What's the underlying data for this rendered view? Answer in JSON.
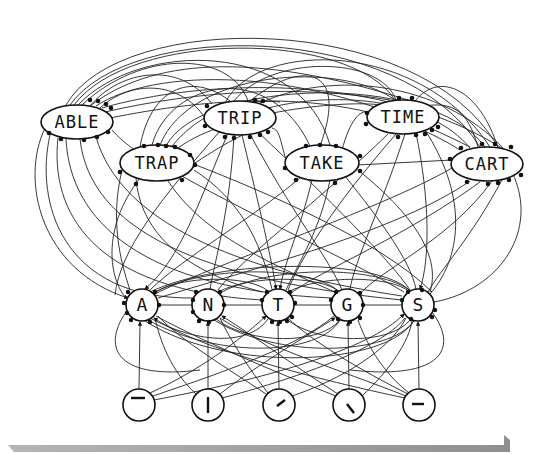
{
  "diagram": {
    "type": "interactive-activation network",
    "layers": {
      "word_level": {
        "nodes": [
          {
            "id": "ABLE",
            "label": "ABLE",
            "cx": 77,
            "cy": 122
          },
          {
            "id": "TRAP",
            "label": "TRAP",
            "cx": 157,
            "cy": 163
          },
          {
            "id": "TRIP",
            "label": "TRIP",
            "cx": 240,
            "cy": 118
          },
          {
            "id": "TAKE",
            "label": "TAKE",
            "cx": 322,
            "cy": 163
          },
          {
            "id": "TIME",
            "label": "TIME",
            "cx": 403,
            "cy": 117
          },
          {
            "id": "CART",
            "label": "CART",
            "cx": 487,
            "cy": 164
          }
        ]
      },
      "letter_level": {
        "nodes": [
          {
            "id": "A",
            "label": "A",
            "cx": 142,
            "cy": 305
          },
          {
            "id": "N",
            "label": "N",
            "cx": 208,
            "cy": 305
          },
          {
            "id": "T",
            "label": "T",
            "cx": 278,
            "cy": 305
          },
          {
            "id": "G",
            "label": "G",
            "cx": 347,
            "cy": 305
          },
          {
            "id": "S",
            "label": "S",
            "cx": 418,
            "cy": 305
          }
        ]
      },
      "feature_level": {
        "nodes": [
          {
            "id": "f1",
            "feature": "horizontal-top",
            "cx": 139,
            "cy": 405
          },
          {
            "id": "f2",
            "feature": "vertical",
            "cx": 208,
            "cy": 405
          },
          {
            "id": "f3",
            "feature": "diagonal-right",
            "cx": 279,
            "cy": 405
          },
          {
            "id": "f4",
            "feature": "diagonal-left",
            "cx": 349,
            "cy": 405
          },
          {
            "id": "f5",
            "feature": "horizontal-middle",
            "cx": 419,
            "cy": 405
          }
        ]
      }
    },
    "legend": {
      "arrowhead": "excitatory connection",
      "dot": "inhibitory connection"
    },
    "colors": {
      "stroke": "#111111",
      "background": "#ffffff",
      "bar": "#9a9a9a"
    }
  }
}
